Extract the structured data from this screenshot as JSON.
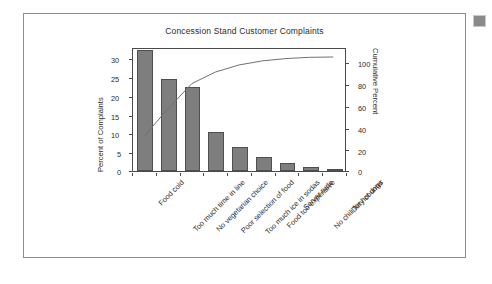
{
  "figure": {
    "title": "Concession Stand Customer Complaints",
    "border_color": "#8c8c8c",
    "bar_fill_color": "#7e7e7e",
    "bar_edge_color": "#4f4f4f",
    "line_color": "#6e6e6e",
    "artifact_color": "#8a8a8a"
  },
  "chart_data": {
    "type": "bar",
    "title": "Concession Stand Customer Complaints",
    "xlabel": "",
    "ylabel": "Percent of Complaints",
    "y2label": "Cumulative Percent",
    "ylim": [
      0,
      32
    ],
    "y2lim": [
      0,
      107
    ],
    "grid": false,
    "legend": "none",
    "categories": [
      "Food cold",
      "Too much time in line",
      "No vegetarian choice",
      "Poor selection of food",
      "Too much ice in sodas",
      "Food too expensive",
      "Server rude",
      "No chili for hot dogs",
      "Dirty counter"
    ],
    "values": [
      31.2,
      23.7,
      21.8,
      10.1,
      6.2,
      3.6,
      2.0,
      1.1,
      0.3
    ],
    "series": [
      {
        "name": "Percent of Complaints",
        "type": "bar",
        "axis": "left",
        "values": [
          31.2,
          23.7,
          21.8,
          10.1,
          6.2,
          3.6,
          2.0,
          1.1,
          0.3
        ]
      },
      {
        "name": "Cumulative Percent",
        "type": "line",
        "axis": "right",
        "values": [
          31.2,
          54.9,
          76.7,
          86.8,
          93.0,
          96.6,
          98.6,
          99.7,
          100.0
        ]
      }
    ],
    "y_ticks": [
      0,
      5,
      10,
      15,
      20,
      25,
      30
    ],
    "y_tick_labels": [
      "0",
      "5",
      "10",
      "15",
      "20",
      "25",
      "30"
    ],
    "y2_ticks": [
      0,
      20,
      40,
      60,
      80,
      100
    ],
    "y2_tick_labels": [
      "0",
      "20",
      "40",
      "60",
      "80",
      "100"
    ]
  }
}
